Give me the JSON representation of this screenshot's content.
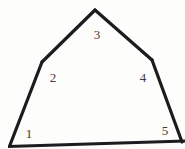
{
  "figure": {
    "name": "numbered-pentagon",
    "background_color": "#fdfdfc",
    "stroke_color": "#1c1c1f",
    "label_color": "#3b3b3f",
    "stroke_width": 3,
    "shape_type": "pentagon",
    "vertices": [
      {
        "id": "1",
        "label": "1",
        "x": 10,
        "y": 145,
        "label_x": 29,
        "label_y": 133
      },
      {
        "id": "2",
        "label": "2",
        "x": 42,
        "y": 62,
        "label_x": 53,
        "label_y": 77
      },
      {
        "id": "3",
        "label": "3",
        "x": 95,
        "y": 10,
        "label_x": 97,
        "label_y": 34
      },
      {
        "id": "4",
        "label": "4",
        "x": 152,
        "y": 60,
        "label_x": 143,
        "label_y": 77
      },
      {
        "id": "5",
        "label": "5",
        "x": 182,
        "y": 142,
        "label_x": 165,
        "label_y": 130
      }
    ],
    "edges": [
      {
        "from": "1",
        "to": "2"
      },
      {
        "from": "2",
        "to": "3"
      },
      {
        "from": "3",
        "to": "4"
      },
      {
        "from": "4",
        "to": "5"
      },
      {
        "from": "5",
        "to": "1"
      }
    ],
    "baseline": {
      "x1": 8,
      "y1": 146,
      "x2": 185,
      "y2": 141
    },
    "polygon_points": "10,145 42,62 95,10 152,60 182,142"
  }
}
